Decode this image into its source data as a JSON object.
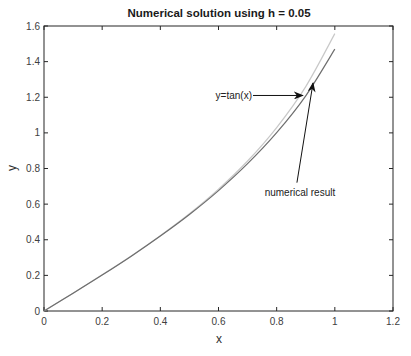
{
  "chart_data": {
    "type": "line",
    "title": "Numerical solution using h = 0.05",
    "xlabel": "x",
    "ylabel": "y",
    "xlim": [
      0,
      1.2
    ],
    "ylim": [
      0,
      1.6
    ],
    "xticks": [
      "0",
      "0.2",
      "0.4",
      "0.6",
      "0.8",
      "1",
      "1.2"
    ],
    "yticks": [
      "0",
      "0.2",
      "0.4",
      "0.6",
      "0.8",
      "1",
      "1.2",
      "1.4",
      "1.6"
    ],
    "grid": false,
    "legend": null,
    "series": [
      {
        "name": "y=tan(x)",
        "color": "#c8c8c8",
        "x": [
          0,
          0.1,
          0.2,
          0.3,
          0.4,
          0.5,
          0.6,
          0.7,
          0.8,
          0.9,
          1.0
        ],
        "y": [
          0,
          0.1,
          0.203,
          0.309,
          0.423,
          0.546,
          0.684,
          0.842,
          1.03,
          1.26,
          1.557
        ]
      },
      {
        "name": "numerical result",
        "color": "#6e6e6e",
        "x": [
          0,
          0.1,
          0.2,
          0.3,
          0.4,
          0.5,
          0.6,
          0.7,
          0.8,
          0.9,
          1.0
        ],
        "y": [
          0,
          0.1,
          0.202,
          0.308,
          0.421,
          0.542,
          0.676,
          0.827,
          1.001,
          1.208,
          1.47
        ]
      }
    ],
    "annotations": [
      {
        "text": "y=tan(x)",
        "text_x": 0.59,
        "text_y": 1.21,
        "arrow_to_x": 0.89,
        "arrow_to_y": 1.21
      },
      {
        "text": "numerical result",
        "text_x": 0.88,
        "text_y": 0.67,
        "arrow_to_x": 0.925,
        "arrow_to_y": 1.28
      }
    ]
  }
}
